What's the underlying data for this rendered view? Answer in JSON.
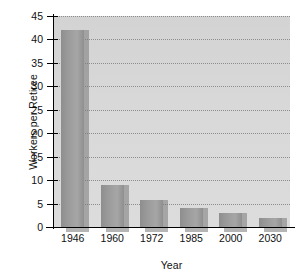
{
  "chart_data": {
    "type": "bar",
    "title": "",
    "xlabel": "Year",
    "ylabel": "Workers per Retiree",
    "categories": [
      "1946",
      "1960",
      "1972",
      "1985",
      "2000",
      "2030"
    ],
    "values": [
      42,
      9,
      5.8,
      4,
      3,
      2
    ],
    "ylim": [
      0,
      45
    ],
    "ytick_labels": [
      "0",
      "5",
      "10",
      "15",
      "20",
      "25",
      "30",
      "35",
      "40",
      "45"
    ],
    "ytick_values": [
      0,
      5,
      10,
      15,
      20,
      25,
      30,
      35,
      40,
      45
    ],
    "grid": "horizontal-dotted",
    "legend": "none",
    "colors": {
      "bar": "#9a9a9a",
      "plot_background": "#d8d8d8",
      "gridline": "#8d8d8d",
      "axis": "#000000",
      "text": "#111111",
      "page_background": "#ffffff"
    }
  }
}
